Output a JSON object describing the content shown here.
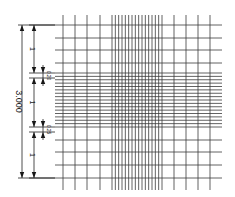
{
  "diagram": {
    "type": "counting-chamber-grid",
    "colors": {
      "line": "#3a3a3a",
      "dimension": "#222222",
      "background": "#ffffff"
    },
    "grid": {
      "left": 55,
      "right": 222,
      "top": 25,
      "bottom": 178,
      "v_extent": {
        "top": 15,
        "bottom": 190
      },
      "vertical_lines": {
        "sparse_left": [
          63,
          75,
          87,
          100
        ],
        "dense": {
          "start": 112,
          "end": 162,
          "count": 16
        },
        "sparse_right": [
          174,
          186,
          198,
          210
        ]
      },
      "horizontal_lines": {
        "sparse_top": [
          25,
          38,
          50,
          63
        ],
        "dense": {
          "start": 73,
          "end": 127,
          "count": 17
        },
        "sparse_bottom": [
          140,
          152,
          165,
          178
        ]
      }
    },
    "dimensions": {
      "overall": {
        "label": "3.000",
        "x": 22,
        "y1": 25,
        "y2": 178
      },
      "segments": [
        {
          "label": "1",
          "x": 34,
          "y1": 25,
          "y2": 73
        },
        {
          "label": "1",
          "x": 34,
          "y1": 78,
          "y2": 127
        },
        {
          "label": "1",
          "x": 34,
          "y1": 132,
          "y2": 178
        }
      ],
      "small": [
        {
          "label": "0.20",
          "x": 43,
          "y1": 73,
          "y2": 78
        },
        {
          "label": "0.25",
          "x": 43,
          "y1": 127,
          "y2": 132
        }
      ]
    }
  }
}
